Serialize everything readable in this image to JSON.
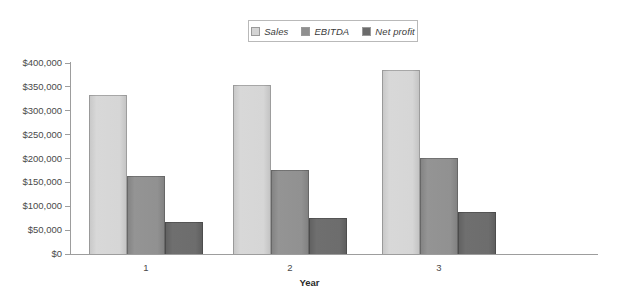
{
  "chart_data": {
    "type": "bar",
    "title": "",
    "xlabel": "Year",
    "ylabel": "",
    "categories": [
      "1",
      "2",
      "3"
    ],
    "series": [
      {
        "name": "Sales",
        "color": "#d4d4d4",
        "values": [
          333000,
          355000,
          385000
        ]
      },
      {
        "name": "EBITDA",
        "color": "#8f8f8f",
        "values": [
          163000,
          176000,
          201000
        ]
      },
      {
        "name": "Net profit",
        "color": "#6b6b6b",
        "values": [
          67000,
          75000,
          88000
        ]
      }
    ],
    "ylim": [
      0,
      400000
    ],
    "ytick_values": [
      0,
      50000,
      100000,
      150000,
      200000,
      250000,
      300000,
      350000,
      400000
    ],
    "ytick_labels": [
      "$0",
      "$50,000",
      "$100,000",
      "$150,000",
      "$200,000",
      "$250,000",
      "$300,000",
      "$350,000",
      "$400,000"
    ],
    "grid": false,
    "legend_position": "top-center"
  },
  "legend": {
    "entries": [
      {
        "label": "Sales"
      },
      {
        "label": "EBITDA"
      },
      {
        "label": "Net profit"
      }
    ]
  },
  "axes": {
    "x_title": "Year",
    "x_labels": [
      "1",
      "2",
      "3"
    ],
    "y_labels": [
      "$400,000",
      "$350,000",
      "$300,000",
      "$250,000",
      "$200,000",
      "$150,000",
      "$100,000",
      "$50,000",
      "$0"
    ]
  },
  "colors": {
    "sales": "#d4d4d4",
    "ebitda": "#8f8f8f",
    "net_profit": "#6b6b6b",
    "axis": "#9d9d9d",
    "text": "#4a4a4a"
  }
}
